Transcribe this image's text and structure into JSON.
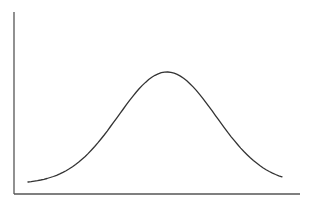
{
  "chart_data": {
    "type": "line",
    "title": "",
    "xlabel": "",
    "ylabel": "",
    "grid": false,
    "legend": null,
    "x": [
      0,
      0.1,
      0.2,
      0.3,
      0.4,
      0.5,
      0.6,
      0.7,
      0.8,
      0.9,
      1.0
    ],
    "series": [
      {
        "name": "curve",
        "values": [
          0.05,
          0.2,
          0.4,
          0.65,
          0.88,
          1.0,
          0.88,
          0.65,
          0.4,
          0.2,
          0.05
        ]
      }
    ],
    "xlim": [
      0,
      1
    ],
    "ylim": [
      0,
      1.1
    ]
  },
  "style": {
    "axis_color": "#555555",
    "curve_color": "#333333",
    "background": "#ffffff"
  },
  "layout": {
    "axis_origin": [
      14,
      194
    ],
    "y_axis_top": 12,
    "x_axis_right": 300,
    "curve_left_px": 28,
    "curve_right_px": 282,
    "curve_base_px": 188,
    "curve_peak_px": 72
  }
}
